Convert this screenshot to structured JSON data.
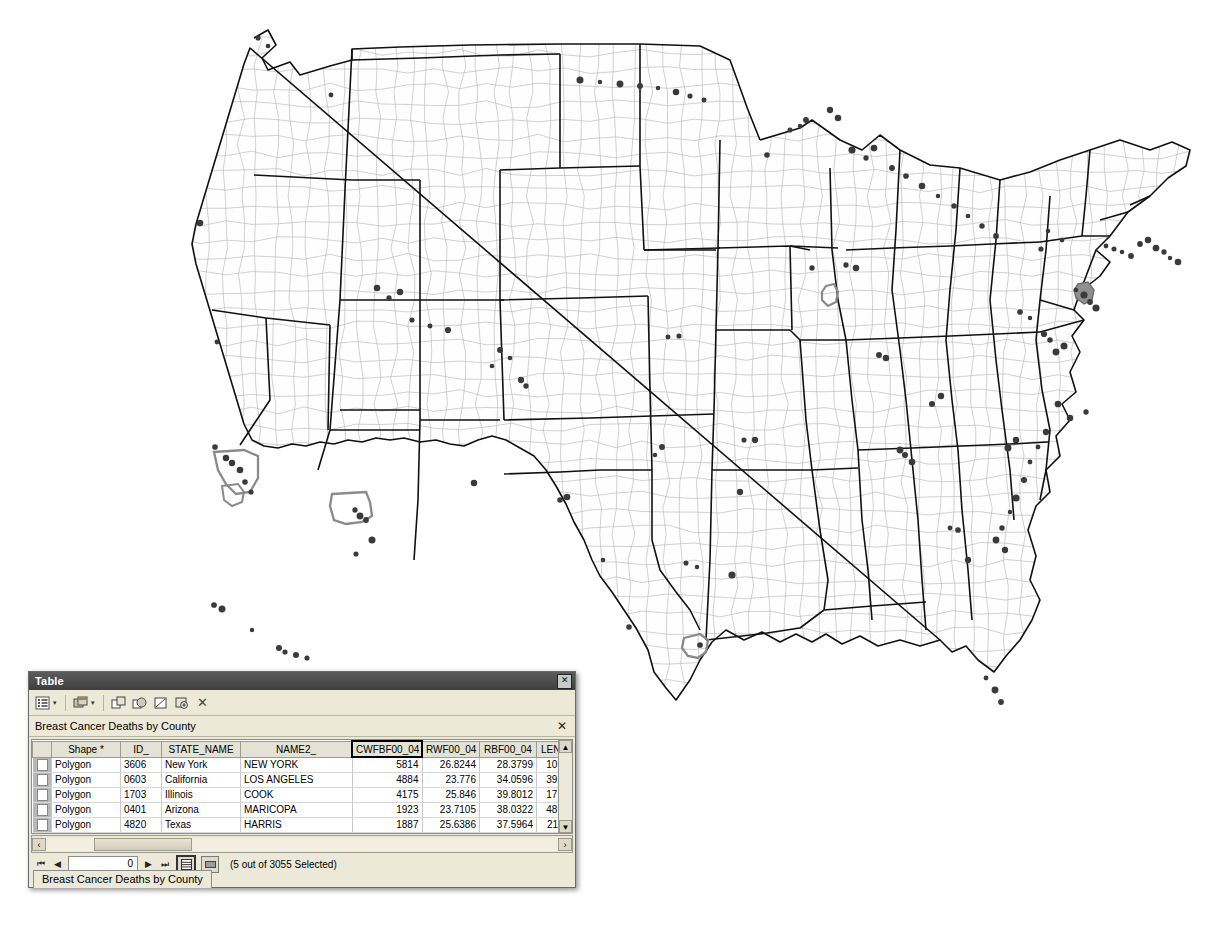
{
  "page": {
    "top_caption": ""
  },
  "map": {
    "name": "us-counties-map",
    "state_border_color": "#111111",
    "county_border_color": "#b9b9b9",
    "fill_color": "#fefefe",
    "point_marker_color": "#3a3a3a",
    "selection_color": "#8a8a8a",
    "selected_counties": [
      "NEW YORK",
      "LOS ANGELES",
      "COOK",
      "MARICOPA",
      "HARRIS",
      "SAN DIEGO"
    ]
  },
  "table_window": {
    "title": "Table",
    "close_label": "✕",
    "toolbar": {
      "table_options_label": "Table Options",
      "table_options_caret": "▾",
      "related_tables_label": "Related Tables",
      "related_tables_caret": "▾",
      "move_field_label": "Move Field",
      "select_all_label": "Select All",
      "switch_selection_label": "Switch Selection",
      "zoom_to_selected_label": "Zoom To Selected",
      "clear_selection_label": "✕"
    },
    "layer_bar": {
      "layer_name": "Breast Cancer Deaths by County",
      "close_label": "✕"
    },
    "grid": {
      "columns": [
        {
          "key": "shape",
          "label": "Shape *",
          "width": 62,
          "align": "left",
          "active": false
        },
        {
          "key": "id",
          "label": "ID_",
          "width": 34,
          "align": "left",
          "active": false
        },
        {
          "key": "state",
          "label": "STATE_NAME",
          "width": 72,
          "align": "left",
          "active": false
        },
        {
          "key": "name2",
          "label": "NAME2_",
          "width": 104,
          "align": "left",
          "active": false
        },
        {
          "key": "cwfbf",
          "label": "CWFBF00_04",
          "width": 62,
          "align": "right",
          "active": true
        },
        {
          "key": "rwf",
          "label": "RWF00_04",
          "width": 50,
          "align": "right",
          "active": false
        },
        {
          "key": "rbf",
          "label": "RBF00_04",
          "width": 50,
          "align": "right",
          "active": false
        },
        {
          "key": "length",
          "label": "LENGTH_",
          "width": 48,
          "align": "right",
          "active": false
        },
        {
          "key": "area",
          "label": "AREA_",
          "width": 46,
          "align": "right",
          "active": false
        }
      ],
      "rows": [
        {
          "shape": "Polygon",
          "id": "3606",
          "state": "New York",
          "name2": "NEW YORK",
          "cwfbf": "5814",
          "rwf": "26.8244",
          "rbf": "28.3799",
          "length": "105.4501",
          "area": "372.324"
        },
        {
          "shape": "Polygon",
          "id": "0603",
          "state": "California",
          "name2": "LOS ANGELES",
          "cwfbf": "4884",
          "rwf": "23.776",
          "rbf": "34.0596",
          "length": "392.5447",
          "area": "4159.16"
        },
        {
          "shape": "Polygon",
          "id": "1703",
          "state": "Illinois",
          "name2": "COOK",
          "cwfbf": "4175",
          "rwf": "25.846",
          "rbf": "39.8012",
          "length": "171.9755",
          "area": "966.300"
        },
        {
          "shape": "Polygon",
          "id": "0401",
          "state": "Arizona",
          "name2": "MARICOPA",
          "cwfbf": "1923",
          "rwf": "23.7105",
          "rbf": "38.0322",
          "length": "489.1984",
          "area": "9313.41"
        },
        {
          "shape": "Polygon",
          "id": "4820",
          "state": "Texas",
          "name2": "HARRIS",
          "cwfbf": "1887",
          "rwf": "25.6386",
          "rbf": "37.5964",
          "length": "211.3369",
          "area": "1780.96"
        },
        {
          "shape": "Polygon",
          "id": "0607",
          "state": "California",
          "name2": "SAN DIEGO",
          "cwfbf": "1796",
          "rwf": "27.4936",
          "rbf": "31.0977",
          "length": "284.9044",
          "area": "4298.08"
        }
      ],
      "scroll_up_label": "▲",
      "scroll_down_label": "▼"
    },
    "hscroll": {
      "left_label": "‹",
      "right_label": "›"
    },
    "status": {
      "first_label": "⏮",
      "prev_label": "◀",
      "record_value": "0",
      "next_label": "▶",
      "last_label": "⏭",
      "show_all_label": "Show all records",
      "show_selected_label": "Show selected records",
      "selection_text": "(5 out of 3055 Selected)"
    },
    "tab": {
      "label": "Breast Cancer Deaths by County"
    }
  }
}
